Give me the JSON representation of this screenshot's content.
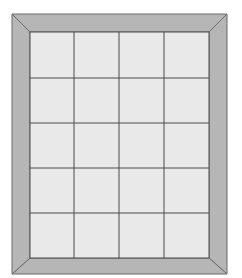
{
  "diagram": {
    "type": "framed-grid",
    "rows": 5,
    "columns": 4,
    "outer_frame": {
      "x": 12,
      "y": 14,
      "width": 215,
      "height": 260
    },
    "inner_area": {
      "x": 30,
      "y": 32,
      "width": 179,
      "height": 226
    },
    "column_lines_x": [
      30,
      74,
      119,
      164,
      209
    ],
    "row_lines_y": [
      32,
      78,
      123,
      168,
      213,
      258
    ],
    "colors": {
      "background": "#ffffff",
      "frame_fill": "#b6b6b6",
      "frame_outline": "#6a6a6a",
      "tile_fill": "#e9e9e9",
      "grid_line": "#4a4a4a"
    }
  }
}
